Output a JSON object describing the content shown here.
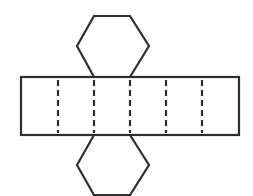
{
  "diagram": {
    "stroke_color": "#2e2e2e",
    "background": "#ffffff",
    "stroke_width": 2.2,
    "top_hexagon": {
      "points": [
        [
          94,
          16
        ],
        [
          130,
          16
        ],
        [
          149,
          46
        ],
        [
          130,
          77
        ],
        [
          94,
          77
        ],
        [
          77,
          46
        ]
      ]
    },
    "bottom_hexagon": {
      "points": [
        [
          94,
          135
        ],
        [
          130,
          135
        ],
        [
          149,
          165
        ],
        [
          130,
          195
        ],
        [
          94,
          195
        ],
        [
          77,
          165
        ]
      ]
    },
    "rectangle": {
      "x": 21,
      "y": 77,
      "width": 218,
      "height": 58
    },
    "fold_lines": {
      "x_positions": [
        58,
        94,
        130,
        166,
        202
      ],
      "y_start": 80,
      "y_end": 133,
      "dash": "6 4"
    },
    "face_count": {
      "lateral_faces": 6,
      "hexagonal_bases": 2
    }
  }
}
